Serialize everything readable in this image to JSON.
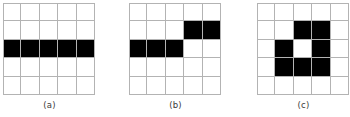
{
  "figure": {
    "background_color": "#ffffff",
    "grid_line_color": "#b3b3b3",
    "fill_color": "#000000",
    "empty_color": "#ffffff",
    "label_color": "#3a3a3a",
    "rows": 5,
    "cols": 5,
    "panels": [
      {
        "id": "a",
        "label": "(a)",
        "left": 3,
        "top": 3,
        "cell_size": 18.4,
        "description": "horizontal bar spanning the full middle row",
        "matrix": [
          [
            0,
            0,
            0,
            0,
            0
          ],
          [
            0,
            0,
            0,
            0,
            0
          ],
          [
            1,
            1,
            1,
            1,
            1
          ],
          [
            0,
            0,
            0,
            0,
            0
          ],
          [
            0,
            0,
            0,
            0,
            0
          ]
        ]
      },
      {
        "id": "b",
        "label": "(b)",
        "left": 129,
        "top": 3,
        "cell_size": 18.4,
        "description": "two offset horizontal bars forming a step",
        "matrix": [
          [
            0,
            0,
            0,
            0,
            0
          ],
          [
            0,
            0,
            0,
            1,
            1
          ],
          [
            1,
            1,
            1,
            0,
            0
          ],
          [
            0,
            0,
            0,
            0,
            0
          ],
          [
            0,
            0,
            0,
            0,
            0
          ]
        ]
      },
      {
        "id": "c",
        "label": "(c)",
        "left": 257,
        "top": 3,
        "cell_size": 18.4,
        "description": "ring shape enclosing a single white hole",
        "matrix": [
          [
            0,
            0,
            0,
            0,
            0
          ],
          [
            0,
            0,
            1,
            1,
            0
          ],
          [
            0,
            1,
            0,
            1,
            0
          ],
          [
            0,
            1,
            1,
            1,
            0
          ],
          [
            0,
            0,
            0,
            0,
            0
          ]
        ]
      }
    ],
    "label_top": 100
  }
}
